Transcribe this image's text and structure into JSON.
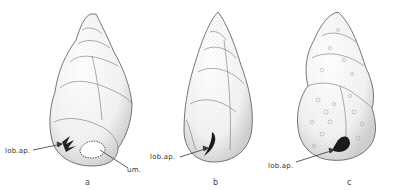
{
  "figure": {
    "type": "scientific illustration",
    "panels": [
      {
        "id": "a",
        "label": "a",
        "annotations": [
          "lob.ap.",
          "um."
        ]
      },
      {
        "id": "b",
        "label": "b",
        "annotations": [
          "lob.ap."
        ]
      },
      {
        "id": "c",
        "label": "c",
        "annotations": [
          "lob.ap."
        ]
      }
    ]
  }
}
